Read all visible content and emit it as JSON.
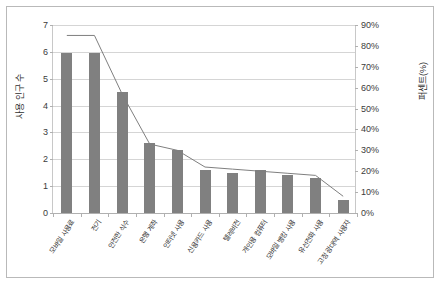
{
  "chart_data": {
    "type": "bar",
    "title": "",
    "subtitle": "",
    "xlabel": "",
    "ylabel": "사용 인구 수",
    "y2label": "퍼센트(%)",
    "grid": true,
    "legend": "none",
    "categories": [
      "모바일 사용료",
      "전기",
      "안전한 식수",
      "은행 계좌",
      "인터넷 사용",
      "신용카드 사용",
      "텔레비전",
      "개인용 컴퓨터",
      "모바일 뱅킹 사용",
      "유선전화 사용",
      "고정 광대역 사용자"
    ],
    "series": [
      {
        "name": "사용 인구 수",
        "type": "bar",
        "axis": "left",
        "color": "#808080",
        "values": [
          5.95,
          5.95,
          4.5,
          2.6,
          2.35,
          1.6,
          1.5,
          1.6,
          1.4,
          1.3,
          0.5
        ]
      },
      {
        "name": "퍼센트(%)",
        "type": "line",
        "axis": "right",
        "color": "#7f7f7f",
        "values": [
          85,
          85,
          57,
          33,
          30,
          22,
          21,
          20,
          19,
          18,
          8
        ]
      }
    ],
    "ylim": [
      0,
      7
    ],
    "ytick_values": [
      0,
      1,
      2,
      3,
      4,
      5,
      6,
      7
    ],
    "yticks": [
      "0",
      "1",
      "2",
      "3",
      "4",
      "5",
      "6",
      "7"
    ],
    "y2lim": [
      0,
      90
    ],
    "y2tick_values": [
      0,
      10,
      20,
      30,
      40,
      50,
      60,
      70,
      80,
      90
    ],
    "y2ticks": [
      "0%",
      "10%",
      "20%",
      "30%",
      "40%",
      "50%",
      "60%",
      "70%",
      "80%",
      "90%"
    ]
  }
}
